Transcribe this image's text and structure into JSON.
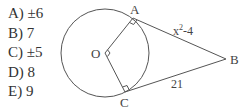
{
  "choices": [
    {
      "letter": "A)",
      "value": "±6"
    },
    {
      "letter": "B)",
      "value": "7"
    },
    {
      "letter": "C)",
      "value": "±5"
    },
    {
      "letter": "D)",
      "value": "8"
    },
    {
      "letter": "E)",
      "value": "9"
    }
  ],
  "diagram": {
    "points": {
      "O": "O",
      "A": "A",
      "B": "B",
      "C": "C"
    },
    "segments": {
      "AB": {
        "base": "x",
        "sup": "2",
        "rest": "-4"
      },
      "CB": "21"
    },
    "colors": {
      "stroke": "#555555",
      "text": "#444444"
    }
  }
}
